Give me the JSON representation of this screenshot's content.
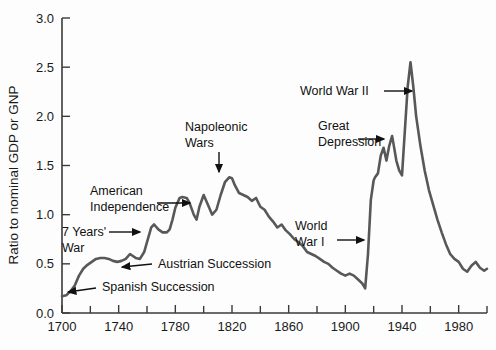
{
  "chart_data": {
    "type": "line",
    "title": "",
    "subtitle": "",
    "xlabel": "",
    "ylabel": "Ratio to nominal GDP or GNP",
    "xlim": [
      1700,
      2000
    ],
    "ylim": [
      0.0,
      3.0
    ],
    "grid": false,
    "legend": "none",
    "x_tick_labels": [
      "1700",
      "1740",
      "1780",
      "1820",
      "1860",
      "1900",
      "1940",
      "1980"
    ],
    "x_tick_values": [
      1700,
      1740,
      1780,
      1820,
      1860,
      1900,
      1940,
      1980
    ],
    "x_minor_tick_values": [
      1720,
      1760,
      1800,
      1840,
      1880,
      1920,
      1960,
      2000
    ],
    "y_tick_labels": [
      "0.0",
      "0.5",
      "1.0",
      "1.5",
      "2.0",
      "2.5",
      "3.0"
    ],
    "y_tick_values": [
      0.0,
      0.5,
      1.0,
      1.5,
      2.0,
      2.5,
      3.0
    ],
    "series": [
      {
        "name": "UK public debt to GDP",
        "color": "#585858",
        "x": [
          1700,
          1703,
          1706,
          1709,
          1712,
          1715,
          1718,
          1721,
          1724,
          1727,
          1730,
          1733,
          1736,
          1739,
          1742,
          1745,
          1748,
          1750,
          1752,
          1755,
          1758,
          1760,
          1763,
          1765,
          1768,
          1771,
          1774,
          1776,
          1778,
          1780,
          1783,
          1785,
          1788,
          1790,
          1793,
          1795,
          1797,
          1800,
          1803,
          1806,
          1809,
          1812,
          1815,
          1818,
          1820,
          1822,
          1825,
          1828,
          1831,
          1834,
          1837,
          1840,
          1843,
          1846,
          1849,
          1852,
          1855,
          1858,
          1861,
          1864,
          1867,
          1870,
          1873,
          1876,
          1879,
          1882,
          1885,
          1888,
          1891,
          1894,
          1897,
          1900,
          1903,
          1906,
          1909,
          1912,
          1914,
          1916,
          1918,
          1920,
          1921,
          1923,
          1925,
          1927,
          1929,
          1931,
          1933,
          1934,
          1936,
          1938,
          1940,
          1942,
          1944,
          1946,
          1948,
          1950,
          1953,
          1956,
          1959,
          1962,
          1965,
          1968,
          1971,
          1974,
          1977,
          1980,
          1983,
          1986,
          1989,
          1992,
          1995,
          1998,
          2000
        ],
        "y": [
          0.17,
          0.18,
          0.22,
          0.28,
          0.38,
          0.45,
          0.49,
          0.52,
          0.55,
          0.56,
          0.56,
          0.55,
          0.53,
          0.52,
          0.53,
          0.55,
          0.6,
          0.58,
          0.56,
          0.55,
          0.62,
          0.72,
          0.87,
          0.9,
          0.85,
          0.82,
          0.82,
          0.85,
          0.95,
          1.07,
          1.17,
          1.18,
          1.17,
          1.12,
          1.0,
          0.95,
          1.08,
          1.2,
          1.1,
          1.0,
          1.05,
          1.2,
          1.33,
          1.38,
          1.37,
          1.3,
          1.22,
          1.2,
          1.18,
          1.14,
          1.17,
          1.08,
          1.05,
          0.98,
          0.93,
          0.87,
          0.9,
          0.84,
          0.8,
          0.75,
          0.72,
          0.68,
          0.62,
          0.6,
          0.58,
          0.55,
          0.52,
          0.5,
          0.46,
          0.43,
          0.4,
          0.38,
          0.4,
          0.38,
          0.34,
          0.3,
          0.25,
          0.6,
          1.15,
          1.35,
          1.38,
          1.42,
          1.6,
          1.68,
          1.55,
          1.7,
          1.8,
          1.72,
          1.55,
          1.45,
          1.4,
          1.85,
          2.3,
          2.55,
          2.3,
          2.0,
          1.7,
          1.45,
          1.25,
          1.1,
          0.95,
          0.82,
          0.7,
          0.6,
          0.55,
          0.52,
          0.45,
          0.42,
          0.48,
          0.52,
          0.46,
          0.43,
          0.45
        ]
      }
    ],
    "annotations": [
      {
        "id": "spanish-succession",
        "label": "Spanish Succession",
        "lines": [
          "Spanish Succession"
        ],
        "text_x": 102,
        "text_y": 291,
        "arrow_x1": 96,
        "arrow_y1": 288,
        "arrow_x2": 68,
        "arrow_y2": 292,
        "align": "start"
      },
      {
        "id": "austrian-succession",
        "label": "Austrian Succession",
        "lines": [
          "Austrian Succession"
        ],
        "text_x": 158,
        "text_y": 268,
        "arrow_x1": 152,
        "arrow_y1": 264,
        "arrow_x2": 122,
        "arrow_y2": 267,
        "align": "start"
      },
      {
        "id": "seven-years-war",
        "label": "7 Years' War",
        "lines": [
          "7 Years'",
          "War"
        ],
        "text_x": 62,
        "text_y": 236,
        "arrow_x1": 109,
        "arrow_y1": 232,
        "arrow_x2": 140,
        "arrow_y2": 232,
        "align": "start"
      },
      {
        "id": "american-independence",
        "label": "American Independence",
        "lines": [
          "American",
          "Independence"
        ],
        "text_x": 90,
        "text_y": 195,
        "arrow_x1": 157,
        "arrow_y1": 203,
        "arrow_x2": 190,
        "arrow_y2": 203,
        "align": "start"
      },
      {
        "id": "napoleonic-wars",
        "label": "Napoleonic Wars",
        "lines": [
          "Napoleonic",
          "Wars"
        ],
        "text_x": 185,
        "text_y": 131,
        "arrow_x1": 219,
        "arrow_y1": 152,
        "arrow_x2": 219,
        "arrow_y2": 172,
        "align": "start"
      },
      {
        "id": "world-war-i",
        "label": "World War I",
        "lines": [
          "World",
          "War I"
        ],
        "text_x": 295,
        "text_y": 230,
        "arrow_x1": 337,
        "arrow_y1": 240,
        "arrow_x2": 364,
        "arrow_y2": 240,
        "align": "start"
      },
      {
        "id": "great-depression",
        "label": "Great Depression",
        "lines": [
          "Great",
          "Depression"
        ],
        "text_x": 318,
        "text_y": 130,
        "arrow_x1": 358,
        "arrow_y1": 139,
        "arrow_x2": 384,
        "arrow_y2": 139,
        "align": "start"
      },
      {
        "id": "world-war-ii",
        "label": "World War II",
        "lines": [
          "World War II"
        ],
        "text_x": 300,
        "text_y": 95,
        "arrow_x1": 384,
        "arrow_y1": 91,
        "arrow_x2": 412,
        "arrow_y2": 91,
        "align": "start"
      }
    ]
  }
}
